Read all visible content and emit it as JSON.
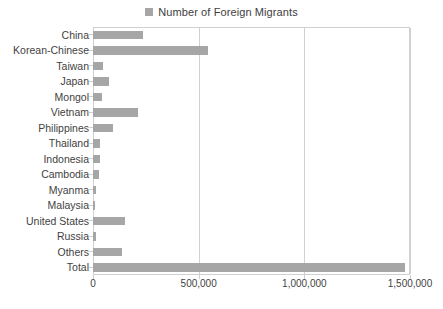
{
  "legend": {
    "swatch_name": "legend-color-swatch",
    "swatch_color": "#a6a6a6",
    "label": "Number of Foreign Migrants"
  },
  "chart_data": {
    "type": "bar",
    "orientation": "horizontal",
    "title": "",
    "legend_entries": [
      "Number of Foreign Migrants"
    ],
    "legend_position": "top-center",
    "series_name": "Number of Foreign Migrants",
    "bar_color": "#a6a6a6",
    "grid": true,
    "gridlines_axis": "x",
    "xlabel": "",
    "ylabel": "",
    "xlim": [
      0,
      1500000
    ],
    "xticks": [
      0,
      500000,
      1000000,
      1500000
    ],
    "xtick_labels": [
      "0",
      "500,000",
      "1,000,000",
      "1,500,000"
    ],
    "categories": [
      "China",
      "Korean-Chinese",
      "Taiwan",
      "Japan",
      "Mongol",
      "Vietnam",
      "Philippines",
      "Thailand",
      "Indonesia",
      "Cambodia",
      "Myanma",
      "Malaysia",
      "United States",
      "Russia",
      "Others",
      "Total"
    ],
    "values": [
      238000,
      543000,
      48000,
      76000,
      43000,
      215000,
      95000,
      33000,
      33000,
      30000,
      12000,
      10000,
      152000,
      15000,
      138000,
      1476000
    ]
  }
}
